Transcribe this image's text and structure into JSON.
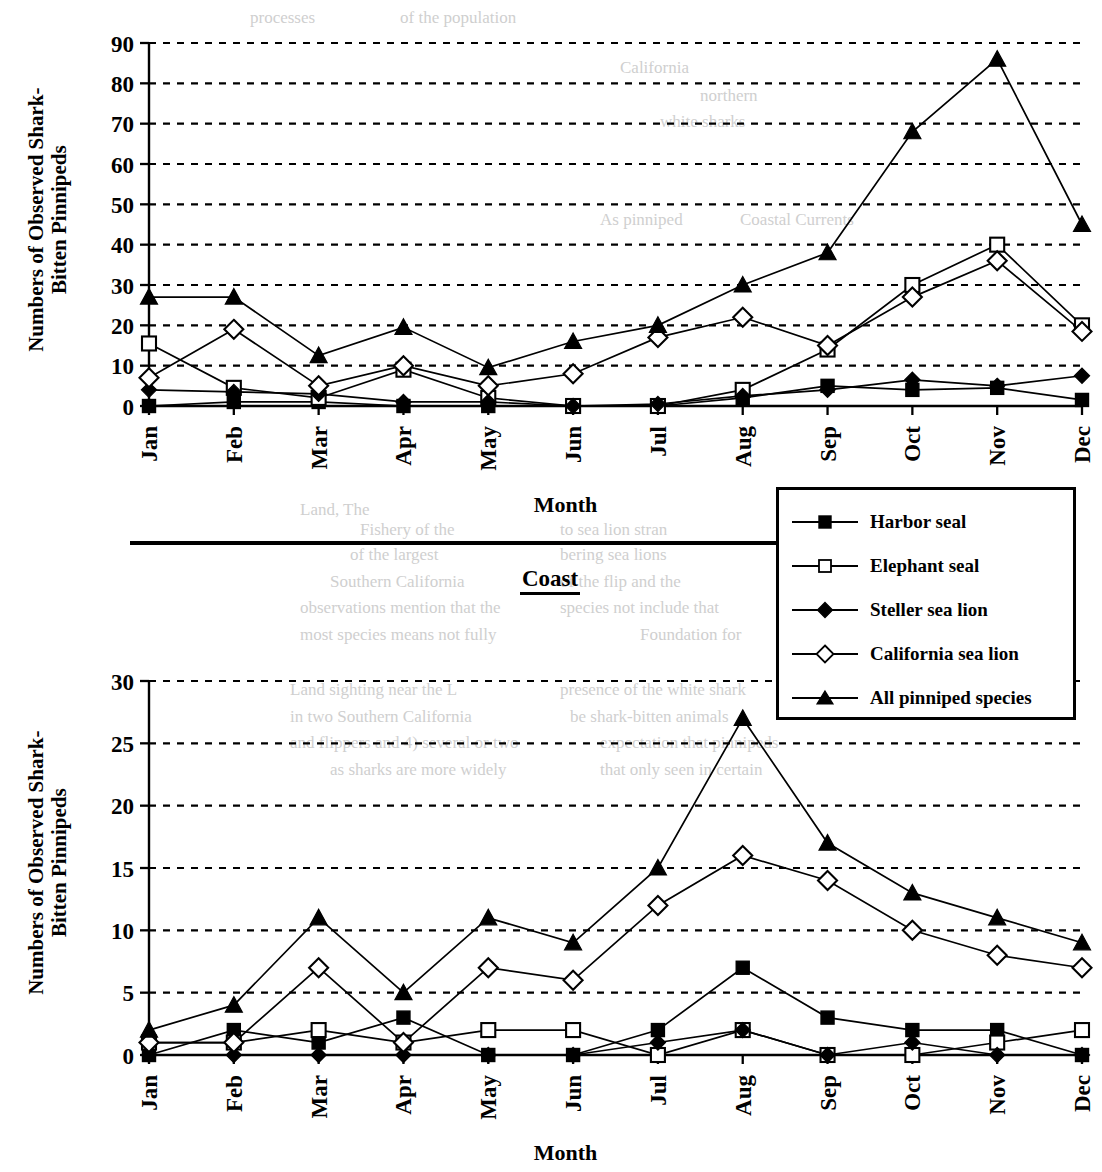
{
  "figure": {
    "divider_present": true,
    "coast_label": "Coast"
  },
  "legend": {
    "position": "center-right between panels",
    "entries": [
      {
        "label": "Harbor seal",
        "marker": "filled-square-icon"
      },
      {
        "label": "Elephant seal",
        "marker": "open-square-icon"
      },
      {
        "label": "Steller sea lion",
        "marker": "filled-diamond-icon"
      },
      {
        "label": "California sea lion",
        "marker": "open-diamond-icon"
      },
      {
        "label": "All pinniped species",
        "marker": "filled-triangle-icon"
      }
    ]
  },
  "chart_data": [
    {
      "id": "top",
      "type": "line",
      "title": "",
      "xlabel": "Month",
      "ylabel": "Numbers of Observed Shark-\nBitten Pinnipeds",
      "ylim": [
        0,
        90
      ],
      "yticks": [
        0,
        10,
        20,
        30,
        40,
        50,
        60,
        70,
        80,
        90
      ],
      "grid": true,
      "legend_position": "outside-right",
      "categories": [
        "Jan",
        "Feb",
        "Mar",
        "Apr",
        "May",
        "Jun",
        "Jul",
        "Aug",
        "Sep",
        "Oct",
        "Nov",
        "Dec"
      ],
      "series": [
        {
          "name": "Harbor seal",
          "marker": "filled-square",
          "values": [
            0,
            1,
            1,
            0,
            0,
            0,
            0,
            2,
            5,
            4,
            4.5,
            1.5
          ]
        },
        {
          "name": "Elephant seal",
          "marker": "open-square",
          "values": [
            15.5,
            4.5,
            2,
            9,
            2,
            0,
            0,
            4,
            14,
            30,
            40,
            20
          ]
        },
        {
          "name": "Steller sea lion",
          "marker": "filled-diamond",
          "values": [
            4,
            3.5,
            3,
            1,
            1,
            0,
            0.5,
            2.5,
            4,
            6.5,
            5,
            7.5
          ]
        },
        {
          "name": "California sea lion",
          "marker": "open-diamond",
          "values": [
            7,
            19,
            5,
            10,
            5,
            8,
            17,
            22,
            15,
            27,
            36,
            18.5
          ]
        },
        {
          "name": "All pinniped species",
          "marker": "filled-triangle",
          "values": [
            27,
            27,
            12.5,
            19.5,
            9.5,
            16,
            20,
            30,
            38,
            68,
            86,
            45
          ]
        }
      ]
    },
    {
      "id": "bottom",
      "type": "line",
      "title": "",
      "xlabel": "Month",
      "ylabel": "Numbers of Observed Shark-\nBitten Pinnipeds",
      "ylim": [
        0,
        30
      ],
      "yticks": [
        0,
        5,
        10,
        15,
        20,
        25,
        30
      ],
      "grid": true,
      "legend_position": "outside-top-right",
      "categories": [
        "Jan",
        "Feb",
        "Mar",
        "Apr",
        "May",
        "Jun",
        "Jul",
        "Aug",
        "Sep",
        "Oct",
        "Nov",
        "Dec"
      ],
      "series": [
        {
          "name": "Harbor seal",
          "marker": "filled-square",
          "values": [
            0,
            2,
            1,
            3,
            0,
            0,
            2,
            7,
            3,
            2,
            2,
            0
          ]
        },
        {
          "name": "Elephant seal",
          "marker": "open-square",
          "values": [
            1,
            1,
            2,
            1,
            2,
            2,
            0,
            2,
            0,
            0,
            1,
            2
          ]
        },
        {
          "name": "Steller sea lion",
          "marker": "filled-diamond",
          "values": [
            0,
            0,
            0,
            0,
            0,
            0,
            1,
            2,
            0,
            1,
            0,
            0
          ]
        },
        {
          "name": "California sea lion",
          "marker": "open-diamond",
          "values": [
            1,
            1,
            7,
            1,
            7,
            6,
            12,
            16,
            14,
            10,
            8,
            7
          ]
        },
        {
          "name": "All pinniped species",
          "marker": "filled-triangle",
          "values": [
            2,
            4,
            11,
            5,
            11,
            9,
            15,
            27,
            17,
            13,
            11,
            9
          ]
        }
      ]
    }
  ],
  "ghost_text": [
    {
      "t": "processes",
      "x": 250,
      "y": 8
    },
    {
      "t": "of the population",
      "x": 400,
      "y": 8
    },
    {
      "t": "California",
      "x": 620,
      "y": 58
    },
    {
      "t": "northern",
      "x": 700,
      "y": 86
    },
    {
      "t": "white sharks",
      "x": 660,
      "y": 112
    },
    {
      "t": "As pinniped",
      "x": 600,
      "y": 210
    },
    {
      "t": "Coastal Currents",
      "x": 740,
      "y": 210
    },
    {
      "t": "Land, The",
      "x": 300,
      "y": 500
    },
    {
      "t": "Fishery of the",
      "x": 360,
      "y": 520
    },
    {
      "t": "to sea lion stran",
      "x": 560,
      "y": 520
    },
    {
      "t": "of the largest",
      "x": 350,
      "y": 545
    },
    {
      "t": "bering sea lions",
      "x": 560,
      "y": 545
    },
    {
      "t": "Southern California",
      "x": 330,
      "y": 572
    },
    {
      "t": "of the flip and the",
      "x": 560,
      "y": 572
    },
    {
      "t": "observations mention that the",
      "x": 300,
      "y": 598
    },
    {
      "t": "species not include that",
      "x": 560,
      "y": 598
    },
    {
      "t": "most species means not fully",
      "x": 300,
      "y": 625
    },
    {
      "t": "Foundation for",
      "x": 640,
      "y": 625
    },
    {
      "t": "Land sighting near the L",
      "x": 290,
      "y": 680
    },
    {
      "t": "presence of the white shark",
      "x": 560,
      "y": 680
    },
    {
      "t": "in two Southern California",
      "x": 290,
      "y": 707
    },
    {
      "t": "be shark-bitten animals",
      "x": 570,
      "y": 707
    },
    {
      "t": "and flippers and 4) several or two",
      "x": 290,
      "y": 733
    },
    {
      "t": "expectation that pinnipeds",
      "x": 600,
      "y": 733
    },
    {
      "t": "as sharks are more widely",
      "x": 330,
      "y": 760
    },
    {
      "t": "that only seen in certain",
      "x": 600,
      "y": 760
    }
  ]
}
